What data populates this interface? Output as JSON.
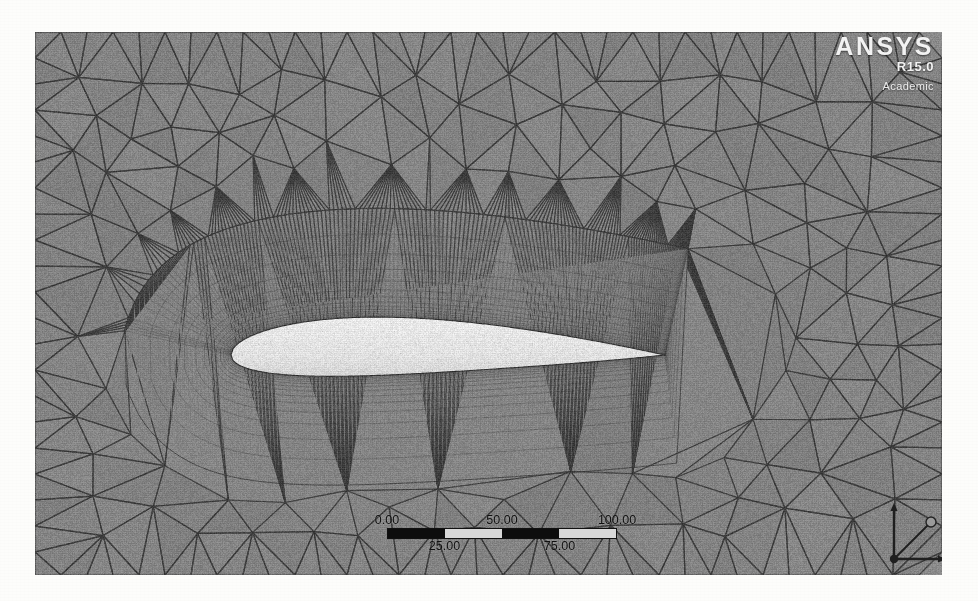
{
  "application": {
    "name": "ANSYS Meshing",
    "logo": {
      "brand": "ANSYS",
      "release": "R15.0",
      "license": "Academic"
    }
  },
  "viewport": {
    "name": "graphics-window",
    "background_color": "#8b8b8b",
    "mesh_line_color": "#3a3a3a",
    "body_fill_color": "#e6e6e6",
    "description": "2D unstructured triangular mesh around an airfoil cross-section with inflation boundary layers"
  },
  "scale_bar": {
    "top_labels": [
      "0.00",
      "50.00",
      "100.00"
    ],
    "bottom_labels": [
      "25.00",
      "75.00"
    ],
    "segments": [
      "on",
      "off",
      "on",
      "off"
    ],
    "units": ""
  },
  "axis_triad": {
    "labels": [
      "X",
      "Y",
      "Z"
    ],
    "origin_label": ""
  },
  "scan_bleed_text": "ㅤ ㅤ ㅤ ㅤ ㅤ ㅤ ㅤ ㅤ"
}
